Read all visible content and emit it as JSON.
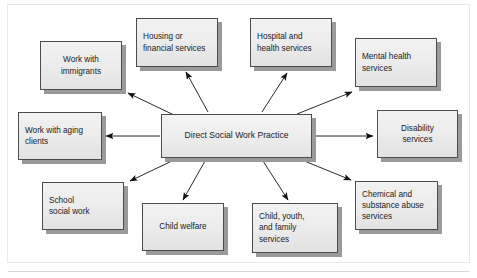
{
  "diagram": {
    "type": "hub-and-spoke",
    "center": {
      "id": "center",
      "label": "Direct Social Work Practice",
      "lines": [
        "Direct Social Work Practice"
      ]
    },
    "nodes": [
      {
        "id": "work-with-immigrants",
        "label": "Work with immigrants",
        "lines": [
          "Work with",
          "immigrants"
        ],
        "align": "center"
      },
      {
        "id": "housing-or-financial-services",
        "label": "Housing or financial services",
        "lines": [
          "Housing or",
          "financial services"
        ],
        "align": "left"
      },
      {
        "id": "hospital-and-health-services",
        "label": "Hospital and health services",
        "lines": [
          "Hospital and",
          "health services"
        ],
        "align": "left"
      },
      {
        "id": "mental-health-services",
        "label": "Mental health services",
        "lines": [
          "Mental health",
          "services"
        ],
        "align": "left"
      },
      {
        "id": "work-with-aging-clients",
        "label": "Work with aging clients",
        "lines": [
          "Work with aging",
          "clients"
        ],
        "align": "left"
      },
      {
        "id": "disability-services",
        "label": "Disability services",
        "lines": [
          "Disability",
          "services"
        ],
        "align": "center"
      },
      {
        "id": "school-social-work",
        "label": "School social work",
        "lines": [
          "School",
          "social work"
        ],
        "align": "left"
      },
      {
        "id": "child-welfare",
        "label": "Child welfare",
        "lines": [
          "Child welfare"
        ],
        "align": "center"
      },
      {
        "id": "child-youth-and-family-services",
        "label": "Child, youth, and family services",
        "lines": [
          "Child, youth,",
          "and family",
          "services"
        ],
        "align": "left"
      },
      {
        "id": "chemical-and-substance-abuse-services",
        "label": "Chemical and substance abuse services",
        "lines": [
          "Chemical and",
          "substance abuse",
          "services"
        ],
        "align": "left"
      }
    ],
    "edges": [
      {
        "from": "center",
        "to": "work-with-immigrants",
        "direction": "outward"
      },
      {
        "from": "center",
        "to": "housing-or-financial-services",
        "direction": "outward"
      },
      {
        "from": "center",
        "to": "hospital-and-health-services",
        "direction": "outward"
      },
      {
        "from": "center",
        "to": "mental-health-services",
        "direction": "outward"
      },
      {
        "from": "center",
        "to": "work-with-aging-clients",
        "direction": "outward"
      },
      {
        "from": "center",
        "to": "disability-services",
        "direction": "outward"
      },
      {
        "from": "center",
        "to": "school-social-work",
        "direction": "outward"
      },
      {
        "from": "center",
        "to": "child-welfare",
        "direction": "outward"
      },
      {
        "from": "center",
        "to": "child-youth-and-family-services",
        "direction": "outward"
      },
      {
        "from": "center",
        "to": "chemical-and-substance-abuse-services",
        "direction": "outward"
      }
    ],
    "colors": {
      "node_fill": "#eeeeee",
      "node_border": "#4c4c4c",
      "node_shadow": "#9a9a9a",
      "arrow": "#111111",
      "text": "#1a1a1a",
      "background": "#ffffff",
      "frame": "#e9e9e9"
    }
  }
}
